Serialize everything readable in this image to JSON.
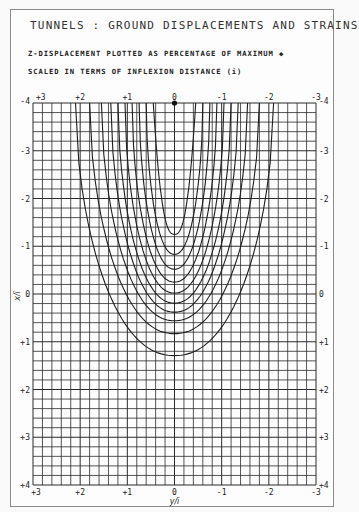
{
  "title": "TUNNELS : GROUND DISPLACEMENTS AND STRAINS",
  "subtitle1": "Z-DISPLACEMENT PLOTTED AS PERCENTAGE OF MAXIMUM ◆",
  "subtitle2": "SCALED IN TERMS OF INFLEXION DISTANCE (i)",
  "chart_data": {
    "type": "contour",
    "title": "TUNNELS : GROUND DISPLACEMENTS AND STRAINS",
    "subtitle": [
      "Z-DISPLACEMENT PLOTTED AS PERCENTAGE OF MAXIMUM",
      "SCALED IN TERMS OF INFLEXION DISTANCE (i)"
    ],
    "xlabel": "y/i",
    "ylabel": "x/i",
    "xlim": [
      3,
      -3
    ],
    "ylim": [
      -4,
      4
    ],
    "x_ticks_top": [
      "+3",
      "+2",
      "+1",
      "0",
      "-1",
      "-2",
      "-3"
    ],
    "x_ticks_bottom": [
      "+3",
      "+2",
      "+1",
      "0",
      "-1",
      "-2",
      "-3"
    ],
    "y_ticks_left": [
      "-4",
      "-3",
      "-2",
      "-1",
      "0",
      "+1",
      "+2",
      "+3",
      "+4"
    ],
    "y_ticks_right": [
      "-4",
      "-3",
      "-2",
      "-1",
      "0",
      "+1",
      "+2",
      "+3",
      "+4"
    ],
    "grid": {
      "on": true,
      "minor_per_unit": 5,
      "columns": 30,
      "rows": 40
    },
    "marker": {
      "label": "max displacement point",
      "y_over_i": 0,
      "x_over_i": -4
    },
    "contours": [
      {
        "level_index": 1,
        "half_width_top": 0.45,
        "bottom_x_over_i": -1.25,
        "tip": "v"
      },
      {
        "level_index": 2,
        "half_width_top": 0.6,
        "bottom_x_over_i": -0.83
      },
      {
        "level_index": 3,
        "half_width_top": 0.75,
        "bottom_x_over_i": -0.52
      },
      {
        "level_index": 4,
        "half_width_top": 0.9,
        "bottom_x_over_i": -0.25
      },
      {
        "level_index": 5,
        "half_width_top": 1.05,
        "bottom_x_over_i": -0.02
      },
      {
        "level_index": 6,
        "half_width_top": 1.2,
        "bottom_x_over_i": 0.19
      },
      {
        "level_index": 7,
        "half_width_top": 1.35,
        "bottom_x_over_i": 0.38
      },
      {
        "level_index": 8,
        "half_width_top": 1.55,
        "bottom_x_over_i": 0.56
      },
      {
        "level_index": 9,
        "half_width_top": 1.8,
        "bottom_x_over_i": 0.83
      },
      {
        "level_index": 10,
        "half_width_top": 2.1,
        "bottom_x_over_i": 1.29
      }
    ]
  }
}
